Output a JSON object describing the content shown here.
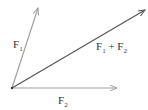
{
  "diagram": {
    "type": "vector-addition",
    "origin": {
      "x": 12,
      "y": 88
    },
    "vectors": [
      {
        "name": "F1",
        "label_main": "F",
        "label_sub": "1",
        "tip": {
          "x": 38,
          "y": 8
        },
        "color": "#a0a0a0"
      },
      {
        "name": "F2",
        "label_main": "F",
        "label_sub": "2",
        "tip": {
          "x": 117,
          "y": 88
        },
        "color": "#a0a0a0"
      },
      {
        "name": "F1+F2",
        "label_a": "F",
        "label_a_sub": "1",
        "label_plus": " + ",
        "label_b": "F",
        "label_b_sub": "2",
        "tip": {
          "x": 145,
          "y": 10
        },
        "color": "#555555"
      }
    ]
  }
}
